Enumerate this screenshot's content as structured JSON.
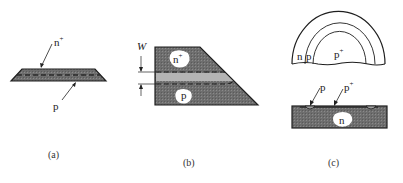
{
  "figure": {
    "panels": [
      {
        "id": "a",
        "caption": "(a)",
        "labels": {
          "top": "n",
          "top_sup": "+",
          "bottom": "p"
        },
        "description": "thin wafer with n+ surface layer over p region, dashed junction line"
      },
      {
        "id": "b",
        "caption": "(b)",
        "labels": {
          "dimension": "W",
          "upper_region": "n",
          "upper_sup": "+",
          "lower_region": "p"
        },
        "description": "beveled wafer cross-section showing n+ and p regions separated by junction width W"
      },
      {
        "id": "c",
        "caption": "(c)",
        "top_view_labels": {
          "outer": "n",
          "middle": "p",
          "inner": "p",
          "inner_sup": "+"
        },
        "section_labels": {
          "left": "p",
          "right": "p",
          "right_sup": "+",
          "substrate": "n"
        },
        "description": "semicircular top view of concentric n, p, p+ rings and cross-section with p and p+ diffusions on n substrate"
      }
    ],
    "colors": {
      "fill_dark": "#6e6e6e",
      "fill_band": "#b4b4b4",
      "stroke": "#1e1e1e",
      "background": "#ffffff"
    }
  }
}
